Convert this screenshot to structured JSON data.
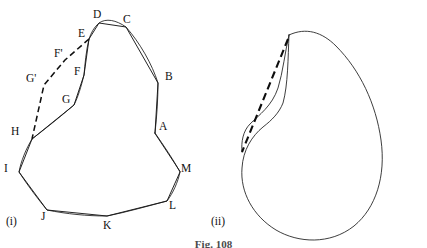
{
  "figure": {
    "caption": "Fig. 108",
    "panels": [
      {
        "id": "panel-i",
        "caption": "(i)",
        "caption_x": 6,
        "caption_y": 216,
        "description": "inscribed-polygon-on-closed-curve"
      },
      {
        "id": "panel-ii",
        "caption": "(ii)",
        "caption_x": 211,
        "caption_y": 216,
        "description": "closed-curve-with-dashed-chord"
      }
    ]
  },
  "panel_i": {
    "vertex_labels": [
      {
        "text": "A",
        "x": 159,
        "y": 121,
        "point_x": 155,
        "point_y": 133
      },
      {
        "text": "B",
        "x": 165,
        "y": 71,
        "point_x": 158,
        "point_y": 83
      },
      {
        "text": "C",
        "x": 123,
        "y": 14,
        "point_x": 126,
        "point_y": 27
      },
      {
        "text": "D",
        "x": 93,
        "y": 9,
        "point_x": 99,
        "point_y": 23
      },
      {
        "text": "E",
        "x": 78,
        "y": 28,
        "point_x": 89,
        "point_y": 39
      },
      {
        "text": "F'",
        "x": 54,
        "y": 48,
        "point_x": 65,
        "point_y": 60
      },
      {
        "text": "F",
        "x": 74,
        "y": 66,
        "point_x": 84,
        "point_y": 75
      },
      {
        "text": "G'",
        "x": 26,
        "y": 73,
        "point_x": 44,
        "point_y": 85
      },
      {
        "text": "G",
        "x": 62,
        "y": 94,
        "point_x": 74,
        "point_y": 105
      },
      {
        "text": "H",
        "x": 11,
        "y": 126,
        "point_x": 32,
        "point_y": 139
      },
      {
        "text": "I",
        "x": 4,
        "y": 163,
        "point_x": 19,
        "point_y": 172
      },
      {
        "text": "J",
        "x": 41,
        "y": 211,
        "point_x": 47,
        "point_y": 210
      },
      {
        "text": "K",
        "x": 103,
        "y": 220,
        "point_x": 107,
        "point_y": 216
      },
      {
        "text": "L",
        "x": 169,
        "y": 200,
        "point_x": 167,
        "point_y": 201
      },
      {
        "text": "M",
        "x": 181,
        "y": 163,
        "point_x": 180,
        "point_y": 172
      }
    ],
    "polygon_path": "M 155,133 L 158,83 L 126,27 L 99,23 L 89,39 L 84,75 L 74,105 L 32,139 L 19,172 L 47,210 L 107,216 L 167,201 L 180,172 Z",
    "curve_path": "M 155,133 C 157,115 158,98 158,83 C 152,64 140,43 126,27 C 116,20 106,18 99,23 C 94,27 91,33 89,39 C 86,51 85,64 84,75 C 81,87 78,97 74,105 C 60,117 45,129 32,139 C 26,149 21,161 19,172 C 28,186 38,199 47,210 C 67,214 87,216 107,216 C 127,212 148,206 167,201 C 173,193 178,182 180,172 C 173,159 164,146 155,133 Z",
    "dashed_path": "M 89,39 L 65,60 L 44,85 L 32,139"
  },
  "panel_ii": {
    "curve_path": "M 289,35 C 306,27 322,32 336,46 C 360,70 376,104 381,140 C 386,176 376,208 354,226 C 330,245 298,243 276,230 C 253,216 240,192 242,168 C 243,150 252,136 263,127 C 272,120 279,113 283,103 C 288,85 288,58 289,35 Z",
    "inner_curve_path": "M 289,35 C 285,52 283,72 278,88 C 272,106 259,115 250,124 C 243,131 241,142 242,152",
    "dashed_path": "M 288,39 L 242,152"
  },
  "colors": {
    "ink": "#111111",
    "background": "#ffffff",
    "caption_ink": "#4a4a4a"
  }
}
